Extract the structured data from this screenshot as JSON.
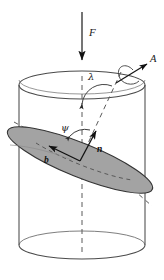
{
  "figure": {
    "background_color": "#ffffff"
  },
  "colors": {
    "outline": "#4a4a4a",
    "disc_fill": "#a3a3a3",
    "disc_edge": "#3a3a3a",
    "dashed": "#555555",
    "vector": "#111111",
    "label": "#1a1a1a"
  },
  "labels": {
    "force": "F",
    "axis_symbol": "A",
    "normal_vector": "n",
    "b_vector": "b",
    "angle_lambda": "λ",
    "angle_psi": "ψ"
  },
  "elements": {
    "cylinder": {
      "name": "cylinder",
      "top_ellipse": {
        "cx": 82,
        "cy": 85,
        "rx": 63,
        "ry": 14
      },
      "bottom_ellipse": {
        "cx": 82,
        "cy": 245,
        "rx": 63,
        "ry": 14
      },
      "left_wall_x": 19,
      "right_wall_x": 145
    },
    "disc": {
      "name": "tilted-disc",
      "cx": 80,
      "cy": 160,
      "rx": 78,
      "ry": 17,
      "rotation_deg": 22,
      "fill": "#a3a3a3"
    },
    "force_arrow": {
      "name": "force-arrow",
      "from": [
        82,
        12
      ],
      "to": [
        82,
        62
      ],
      "direction": "down"
    },
    "axis_arrow": {
      "name": "axis-a-arrow",
      "from": [
        118,
        82
      ],
      "to": [
        148,
        63
      ],
      "direction": "up-right"
    },
    "normal_arrow": {
      "name": "normal-n-arrow",
      "from": [
        80,
        160
      ],
      "to": [
        96,
        133
      ],
      "direction": "up-right"
    },
    "b_arrow": {
      "name": "b-vector-arrow",
      "from": [
        80,
        160
      ],
      "to": [
        47,
        145
      ],
      "direction": "up-left"
    },
    "vertical_dashed_axis": {
      "name": "vertical-axis-dashed",
      "from": [
        82,
        80
      ],
      "to": [
        82,
        252
      ]
    },
    "tilted_dashed_axis": {
      "name": "tilted-axis-dashed",
      "from": [
        118,
        78
      ],
      "to": [
        50,
        195
      ]
    }
  }
}
